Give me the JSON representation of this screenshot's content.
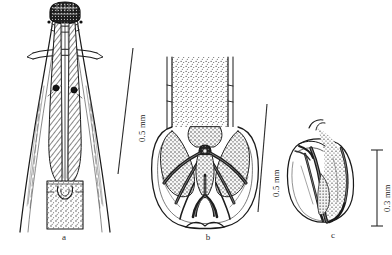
{
  "plate": {
    "width": 392,
    "height": 255,
    "background": "#ffffff",
    "ink": "#1a1a1a",
    "stipple": "#4a4a4a"
  },
  "panels": [
    {
      "id": "a",
      "label": "a",
      "caption_x": 64,
      "caption_y": 236,
      "description": "anterior-end-ventral-view",
      "scale": {
        "value": "0.5 mm",
        "label": "0.5 mm",
        "x1": 131,
        "y1": 48,
        "x2": 117,
        "y2": 172,
        "text_x": 134,
        "text_y": 136,
        "rotation": -90,
        "ticks": "none"
      }
    },
    {
      "id": "b",
      "label": "b",
      "caption_x": 208,
      "caption_y": 236,
      "description": "caudal-bursa-ventral-view",
      "scale": {
        "value": "0.5 mm",
        "label": "0.5 mm",
        "x1": 266,
        "y1": 105,
        "x2": 257,
        "y2": 211,
        "text_x": 268,
        "text_y": 192,
        "rotation": -90,
        "ticks": "none"
      }
    },
    {
      "id": "c",
      "label": "c",
      "caption_x": 333,
      "caption_y": 236,
      "description": "caudal-bursa-lateral-view",
      "scale": {
        "value": "0.3 mm",
        "label": "0.3 mm",
        "x1": 376,
        "y1": 150,
        "x2": 376,
        "y2": 226,
        "text_x": 379,
        "text_y": 212,
        "rotation": -90,
        "ticks": "both"
      }
    }
  ]
}
